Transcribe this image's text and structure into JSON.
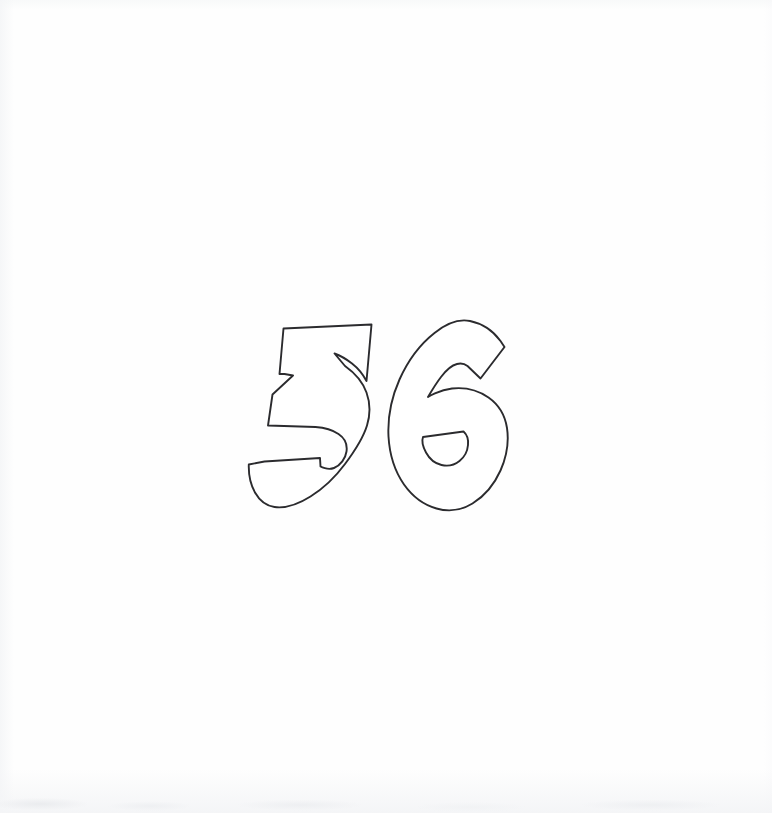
{
  "page": {
    "title": "36",
    "background_color": "#fefefe",
    "width": 772,
    "height": 813,
    "kind": "scanned outline drawing",
    "description": "Coloring-page style outline of the number 36 in bubble lettering"
  },
  "artwork": {
    "name": "number-36-outline",
    "label": "36",
    "style": "bubble-outline",
    "stroke_color": "#2b2b2e",
    "fill_color": "#ffffff",
    "stroke_width": "1.9",
    "bounding_box": {
      "x": 263,
      "y": 318,
      "width": 245,
      "height": 192
    },
    "glyphs": [
      {
        "name": "digit-3",
        "character": "3",
        "bounding_box": {
          "x": 263,
          "y": 320,
          "width": 108,
          "height": 190
        },
        "counters": 0
      },
      {
        "name": "digit-6",
        "character": "6",
        "bounding_box": {
          "x": 392,
          "y": 318,
          "width": 116,
          "height": 192
        },
        "counters": 1
      }
    ]
  },
  "artifacts": {
    "bottom_smudge": "faint scanner shadow along the bottom edge",
    "edge_tint": "light gray paper tint along the left and bottom margins"
  }
}
